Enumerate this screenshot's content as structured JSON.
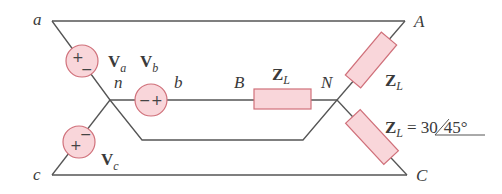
{
  "diagram": {
    "type": "three-phase Y-Y circuit",
    "nodes": {
      "a": "a",
      "b": "b",
      "c": "c",
      "n": "n",
      "A": "A",
      "B": "B",
      "C": "C",
      "N": "N"
    },
    "sources": [
      {
        "name": "V",
        "sub": "a",
        "polarity_top": "+",
        "polarity_bottom": "−"
      },
      {
        "name": "V",
        "sub": "b",
        "polarity_left": "−",
        "polarity_right": "+"
      },
      {
        "name": "V",
        "sub": "c",
        "polarity_top": "−",
        "polarity_bottom": "+"
      }
    ],
    "loads": [
      {
        "name": "Z",
        "sub": "L"
      },
      {
        "name": "Z",
        "sub": "L"
      },
      {
        "name": "Z",
        "sub": "L",
        "eq": "=",
        "magnitude": "30",
        "angle": "45°"
      }
    ],
    "colors": {
      "wire": "#555555",
      "component_fill": "#f9d6da",
      "component_stroke": "#d0707a"
    }
  }
}
